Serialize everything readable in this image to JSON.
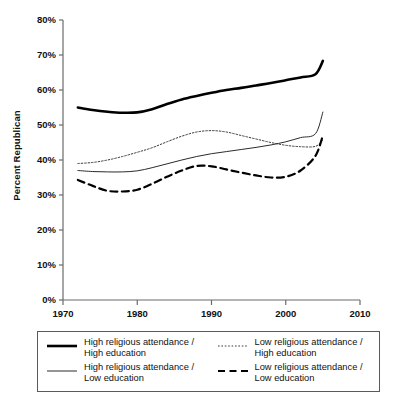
{
  "chart_data": {
    "type": "line",
    "title": "",
    "subtitle": "",
    "xlabel": "",
    "ylabel": "Percent Republican",
    "xlim": [
      1970,
      2010
    ],
    "ylim": [
      0,
      80
    ],
    "xticks": [
      1970,
      1980,
      1990,
      2000,
      2010
    ],
    "xtick_labels": [
      "1970",
      "1980",
      "1990",
      "2000",
      "2010"
    ],
    "yticks": [
      0,
      10,
      20,
      30,
      40,
      50,
      60,
      70,
      80
    ],
    "ytick_labels": [
      "0%",
      "10%",
      "20%",
      "30%",
      "40%",
      "50%",
      "60%",
      "70%",
      "80%"
    ],
    "grid": false,
    "legend_position": "below-plot",
    "x": [
      1972,
      1974,
      1976,
      1978,
      1980,
      1982,
      1984,
      1986,
      1988,
      1990,
      1992,
      1994,
      1996,
      1998,
      2000,
      2002,
      2004,
      2005
    ],
    "series": [
      {
        "name": "High religious attendance / High education",
        "style": "solid-thick",
        "color": "#000000",
        "values": [
          55.0,
          54.3,
          53.8,
          53.5,
          53.6,
          54.5,
          56.0,
          57.3,
          58.3,
          59.2,
          60.0,
          60.6,
          61.3,
          62.0,
          62.8,
          63.6,
          64.5,
          68.3
        ]
      },
      {
        "name": "Low religious attendance / High education",
        "style": "dotted",
        "color": "#3a3a3a",
        "values": [
          39.0,
          39.3,
          40.0,
          41.0,
          42.2,
          43.5,
          45.2,
          46.8,
          48.0,
          48.4,
          48.0,
          47.0,
          46.0,
          45.0,
          44.2,
          43.8,
          43.9,
          45.7
        ]
      },
      {
        "name": "High religious attendance / Low education",
        "style": "solid-thin",
        "color": "#2b2b2b",
        "values": [
          37.0,
          36.7,
          36.6,
          36.6,
          36.9,
          37.8,
          38.9,
          40.0,
          41.0,
          41.8,
          42.4,
          43.0,
          43.6,
          44.3,
          45.2,
          46.4,
          47.5,
          53.7
        ]
      },
      {
        "name": "Low religious attendance / Low education",
        "style": "dashed",
        "color": "#000000",
        "values": [
          34.3,
          32.6,
          31.2,
          31.0,
          31.5,
          33.2,
          35.2,
          37.0,
          38.3,
          38.2,
          37.3,
          36.4,
          35.6,
          35.0,
          35.2,
          37.0,
          41.2,
          47.0
        ]
      }
    ]
  },
  "axis": {
    "ylabel": "Percent Republican",
    "ytick_labels": [
      "80%",
      "70%",
      "60%",
      "50%",
      "40%",
      "30%",
      "20%",
      "10%",
      "0%"
    ],
    "xtick_labels": [
      "1970",
      "1980",
      "1990",
      "2000",
      "2010"
    ]
  },
  "legend": {
    "entries": [
      {
        "label": "High religious attendance /\nHigh education",
        "style": "solid-thick"
      },
      {
        "label": "Low religious attendance /\nHigh education",
        "style": "dotted"
      },
      {
        "label": "High religious attendance /\nLow education",
        "style": "solid-thin"
      },
      {
        "label": "Low religious attendance /\nLow education",
        "style": "dashed"
      }
    ]
  }
}
